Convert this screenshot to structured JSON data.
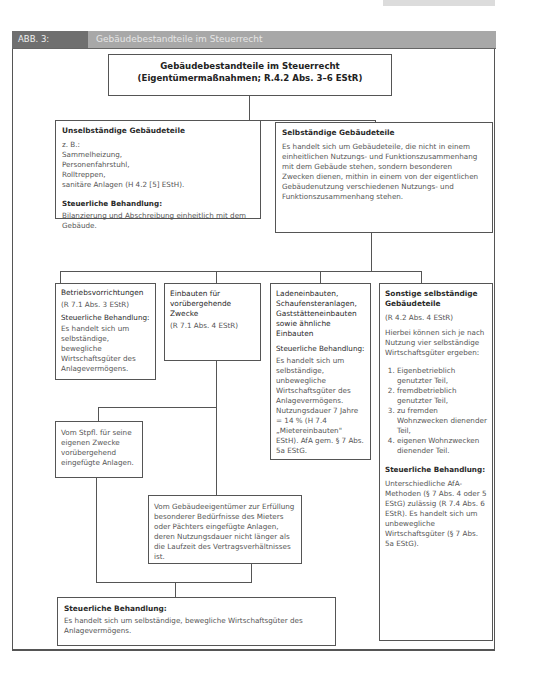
{
  "page_badge": "",
  "figure": {
    "number": "ABB. 3:",
    "title": "Gebäudebestandteile im Steuerrecht"
  },
  "top_box": {
    "title": "Gebäudebestandteile im Steuerrecht (Eigentümermaßnahmen; R.4.2 Abs. 3–6 EStR)"
  },
  "unselbstaendig": {
    "title": "Unselbständige Gebäudeteile",
    "examples_label": "z. B.:",
    "examples": [
      "Sammelheizung,",
      "Personenfahrstuhl,",
      "Rolltreppen,",
      "sanitäre Anlagen (H 4.2 [5] EStH)."
    ],
    "treatment_label": "Steuerliche Behandlung:",
    "treatment": "Bilanzierung und Abschreibung einheitlich mit dem Gebäude."
  },
  "selbstaendig": {
    "title": "Selbständige Gebäudeteile",
    "text": "Es handelt sich um Gebäudeteile, die nicht in einem einheitlichen Nutzungs- und Funktionszusammenhang mit dem Gebäude stehen, sondern besonderen Zwecken dienen, mithin in einem von der eigentlichen Gebäudenutzung verschiedenen Nutzungs- und Funktionszusammenhang stehen."
  },
  "betriebsvorrichtungen": {
    "title": "Betriebsvorrichtungen",
    "ref": "(R 7.1 Abs. 3 EStR)",
    "treatment_label": "Steuerliche Behandlung:",
    "treatment": "Es handelt sich um selbständige, bewegliche Wirtschaftsgüter des Anlagevermögens."
  },
  "einbauten": {
    "title": "Einbauten für vorübergehende Zwecke",
    "ref": "(R 7.1 Abs. 4 EStR)"
  },
  "ladeneinbauten": {
    "title": "Ladeneinbauten, Schaufensteranlagen, Gaststätteneinbauten sowie ähnliche Einbauten",
    "treatment_label": "Steuerliche Behandlung:",
    "treatment": "Es handelt sich um selbständige, unbewegliche Wirtschaftsgüter des Anlagevermögens. Nutzungsdauer 7 Jahre = 14 % (H 7.4 „Mietereinbauten\" EStH). AfA gem. § 7 Abs. 5a EStG."
  },
  "sonstige": {
    "title": "Sonstige selbständige Gebäudeteile",
    "ref": "(R 4.2 Abs. 4 EStR)",
    "intro": "Hierbei können sich je nach Nutzung vier selbständige Wirtschaftsgüter ergeben:",
    "items": [
      "Eigenbetrieblich genutzter Teil,",
      "fremdbetrieblich genutzter Teil,",
      "zu fremden Wohnzwecken dienender Teil,",
      "eigenen Wohnzwecken dienender Teil."
    ],
    "treatment_label": "Steuerliche Behandlung:",
    "treatment": "Unterschiedliche AfA-Methoden (§ 7 Abs. 4 oder 5 EStG) zulässig (R 7.4 Abs. 6 EStR). Es handelt sich um unbewegliche Wirtschaftsgüter (§ 7 Abs. 5a EStG)."
  },
  "stpfl": {
    "text": "Vom Stpfl. für seine eigenen Zwecke vorübergehend eingefügte Anlagen."
  },
  "gebaeudeeigentuemer": {
    "text": "Vom Gebäudeeigentümer zur Erfüllung besonderer Bedürfnisse des Mieters oder Pächters eingefügte Anlagen, deren Nutzungsdauer nicht länger als die Laufzeit des Vertragsverhältnisses ist."
  },
  "bottom_box": {
    "treatment_label": "Steuerliche Behandlung:",
    "treatment": "Es handelt sich um selbständige, bewegliche Wirtschaftsgüter des Anlagevermögens."
  }
}
